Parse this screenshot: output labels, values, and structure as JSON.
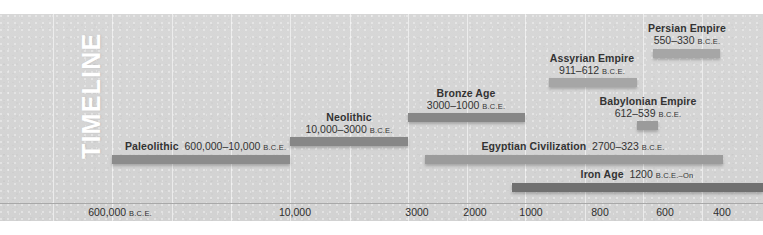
{
  "figure": {
    "title_vertical": "TIMELINE",
    "background_color": "#d5d5d5",
    "axis_color": "#a8a8a8",
    "label_color": "#333333"
  },
  "chart_data": {
    "type": "bar",
    "title": "TIMELINE",
    "orientation": "horizontal-ranges",
    "xlabel": "",
    "ylabel": "",
    "grid": true,
    "legend": "none",
    "axis_ticks": [
      {
        "label": "600,000",
        "suffix": "B.C.E.",
        "x": 120
      },
      {
        "label": "10,000",
        "suffix": "",
        "x": 295
      },
      {
        "label": "3000",
        "suffix": "",
        "x": 417
      },
      {
        "label": "2000",
        "suffix": "",
        "x": 475
      },
      {
        "label": "1000",
        "suffix": "",
        "x": 531
      },
      {
        "label": "800",
        "suffix": "",
        "x": 600
      },
      {
        "label": "600",
        "suffix": "",
        "x": 665
      },
      {
        "label": "400",
        "suffix": "",
        "x": 722
      }
    ],
    "gridlines_x": [
      53,
      112,
      172,
      231,
      290,
      350,
      408,
      467,
      525,
      585,
      643,
      702
    ],
    "series": [
      {
        "name": "Paleolithic",
        "range": "600,000–10,000",
        "suffix": "B.C.E.",
        "start": 600000,
        "end": 10000,
        "bar": {
          "x": 112,
          "y": 155,
          "width": 178,
          "color": "#8c8c8c"
        },
        "label": {
          "x": 125,
          "y": 141,
          "align": "left",
          "layout": "inline"
        }
      },
      {
        "name": "Neolithic",
        "range": "10,000–3000",
        "suffix": "B.C.E.",
        "start": 10000,
        "end": 3000,
        "bar": {
          "x": 290,
          "y": 137,
          "width": 118,
          "color": "#878787"
        },
        "label": {
          "x": 349,
          "y": 112,
          "align": "center",
          "layout": "stacked"
        }
      },
      {
        "name": "Bronze Age",
        "range": "3000–1000",
        "suffix": "B.C.E.",
        "start": 3000,
        "end": 1000,
        "bar": {
          "x": 408,
          "y": 113,
          "width": 117,
          "color": "#878787"
        },
        "label": {
          "x": 466,
          "y": 88,
          "align": "center",
          "layout": "stacked"
        }
      },
      {
        "name": "Assyrian Empire",
        "range": "911–612",
        "suffix": "B.C.E.",
        "start": 911,
        "end": 612,
        "bar": {
          "x": 549,
          "y": 78,
          "width": 88,
          "color": "#a6a6a6"
        },
        "label": {
          "x": 592,
          "y": 53,
          "align": "center",
          "layout": "stacked"
        }
      },
      {
        "name": "Persian Empire",
        "range": "550–330",
        "suffix": "B.C.E.",
        "start": 550,
        "end": 330,
        "bar": {
          "x": 653,
          "y": 49,
          "width": 67,
          "color": "#a6a6a6"
        },
        "label": {
          "x": 687,
          "y": 23,
          "align": "center",
          "layout": "stacked"
        }
      },
      {
        "name": "Babylonian Empire",
        "range": "612–539",
        "suffix": "B.C.E.",
        "start": 612,
        "end": 539,
        "bar": {
          "x": 637,
          "y": 121,
          "width": 21,
          "color": "#9b9b9b"
        },
        "label": {
          "x": 648,
          "y": 96,
          "align": "center",
          "layout": "stacked"
        }
      },
      {
        "name": "Egyptian Civilization",
        "range": "2700–323",
        "suffix": "B.C.E.",
        "start": 2700,
        "end": 323,
        "bar": {
          "x": 425,
          "y": 155,
          "width": 298,
          "color": "#9b9b9b"
        },
        "label": {
          "x": 573,
          "y": 141,
          "align": "center",
          "layout": "inline"
        }
      },
      {
        "name": "Iron Age",
        "range": "1200",
        "suffix": "B.C.E.–On",
        "start": 1200,
        "end": null,
        "bar": {
          "x": 512,
          "y": 183,
          "width": 251,
          "color": "#707070"
        },
        "label": {
          "x": 637,
          "y": 169,
          "align": "center",
          "layout": "inline"
        }
      }
    ]
  }
}
